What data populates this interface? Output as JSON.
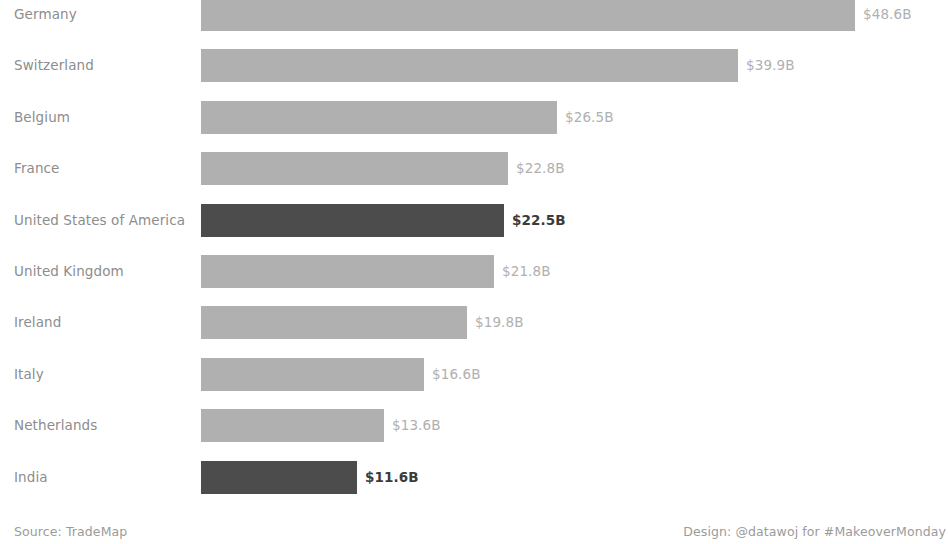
{
  "chart_data": {
    "type": "bar",
    "orientation": "horizontal",
    "title": "",
    "xlabel": "",
    "ylabel": "",
    "categories": [
      "Germany",
      "Switzerland",
      "Belgium",
      "France",
      "United States of America",
      "United Kingdom",
      "Ireland",
      "Italy",
      "Netherlands",
      "India"
    ],
    "values": [
      48.6,
      39.9,
      26.5,
      22.8,
      22.5,
      21.8,
      19.8,
      16.6,
      13.6,
      11.6
    ],
    "value_labels": [
      "$48.6B",
      "$39.9B",
      "$26.5B",
      "$22.8B",
      "$22.5B",
      "$21.8B",
      "$19.8B",
      "$16.6B",
      "$13.6B",
      "$11.6B"
    ],
    "unit": "billions of US dollars",
    "highlighted": [
      "United States of America",
      "India"
    ],
    "xlim": [
      0,
      48.6
    ],
    "grid": false,
    "legend": false,
    "colors": {
      "bar_default": "#b0b0b0",
      "bar_highlight": "#4c4c4c",
      "label_default": "#8d8d8d",
      "value_default": "#b0b0b0",
      "value_highlight": "#3b3b3b",
      "background": "#ffffff"
    }
  },
  "rows": [
    {
      "label": "Germany",
      "value_label": "$48.6B",
      "highlight": false
    },
    {
      "label": "Switzerland",
      "value_label": "$39.9B",
      "highlight": false
    },
    {
      "label": "Belgium",
      "value_label": "$26.5B",
      "highlight": false
    },
    {
      "label": "France",
      "value_label": "$22.8B",
      "highlight": false
    },
    {
      "label": "United States of America",
      "value_label": "$22.5B",
      "highlight": true
    },
    {
      "label": "United Kingdom",
      "value_label": "$21.8B",
      "highlight": false
    },
    {
      "label": "Ireland",
      "value_label": "$19.8B",
      "highlight": false
    },
    {
      "label": "Italy",
      "value_label": "$16.6B",
      "highlight": false
    },
    {
      "label": "Netherlands",
      "value_label": "$13.6B",
      "highlight": false
    },
    {
      "label": "India",
      "value_label": "$11.6B",
      "highlight": true
    }
  ],
  "footer": {
    "source": "Source: TradeMap",
    "design": "Design: @datawoj for #MakeoverMonday"
  }
}
